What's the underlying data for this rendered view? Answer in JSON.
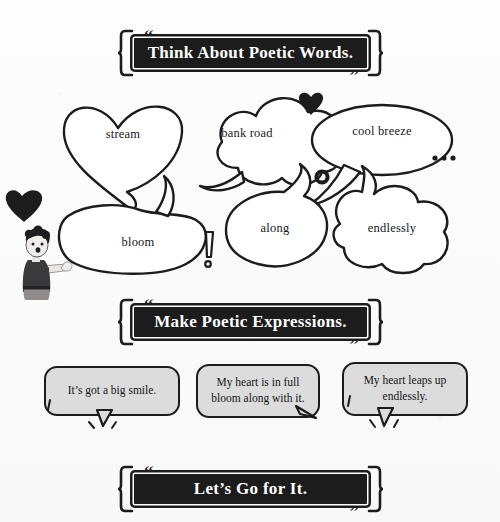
{
  "page": {
    "background_color": "#fbfbfb",
    "ink_color": "#1c1c1c",
    "bubble_fill": "#ffffff",
    "sentence_bubble_fill": "#dcdcdc"
  },
  "banners": [
    {
      "id": "banner1",
      "title": "Think About Poetic Words.",
      "quote_open": "“",
      "quote_close": "”"
    },
    {
      "id": "banner2",
      "title": "Make Poetic Expressions.",
      "quote_open": "“",
      "quote_close": "”"
    },
    {
      "id": "banner3",
      "title": "Let’s Go for It.",
      "quote_open": "“",
      "quote_close": "”"
    }
  ],
  "word_bubbles": [
    {
      "id": "stream",
      "label": "stream",
      "shape": "heart"
    },
    {
      "id": "bank-road",
      "label": "bank road",
      "shape": "cloud"
    },
    {
      "id": "cool-breeze",
      "label": "cool breeze",
      "shape": "oval"
    },
    {
      "id": "bloom",
      "label": "bloom",
      "shape": "bean"
    },
    {
      "id": "along",
      "label": "along",
      "shape": "round"
    },
    {
      "id": "endlessly",
      "label": "endlessly",
      "shape": "cloud"
    }
  ],
  "decorations": [
    {
      "id": "heart-left",
      "type": "heart-solid"
    },
    {
      "id": "heart-top",
      "type": "heart-solid"
    },
    {
      "id": "ring",
      "type": "ring-outline"
    },
    {
      "id": "ellipsis",
      "type": "three-dots"
    },
    {
      "id": "exclamation",
      "type": "exclamation-outline"
    }
  ],
  "sentences": [
    {
      "id": "sb1",
      "text": "It’s got a big smile."
    },
    {
      "id": "sb2",
      "text": "My heart is in full bloom along with it."
    },
    {
      "id": "sb3",
      "text": "My heart leaps up endlessly."
    }
  ],
  "character": {
    "description": "person pointing right"
  }
}
